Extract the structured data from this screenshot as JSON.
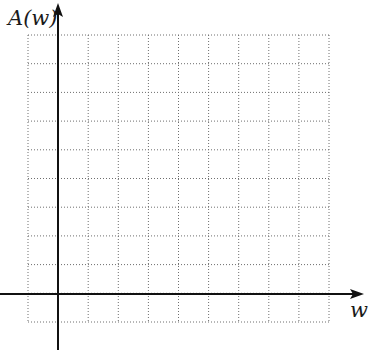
{
  "figure": {
    "y_axis_label": "A(w)",
    "x_axis_label": "w",
    "grid": {
      "columns": 10,
      "rows": 10,
      "left": 28,
      "right": 329,
      "top": 35,
      "bottom": 322,
      "line_style": "dotted",
      "line_color": "#6e6e6e"
    },
    "axes": {
      "color": "#111111",
      "origin_x": 58,
      "origin_y": 294,
      "x_axis_start": 0,
      "x_axis_end": 364,
      "y_axis_top": 3,
      "y_axis_bottom": 350
    }
  }
}
